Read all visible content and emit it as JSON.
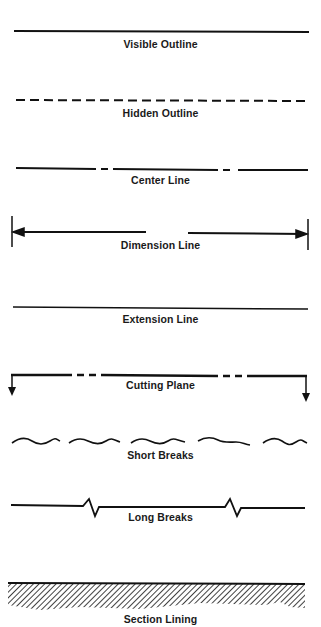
{
  "diagram": {
    "colors": {
      "ink": "#111111",
      "background": "#ffffff"
    },
    "items": [
      {
        "id": "visible-outline",
        "label": "Visible Outline",
        "style": "solid-thick"
      },
      {
        "id": "hidden-outline",
        "label": "Hidden Outline",
        "style": "dashed"
      },
      {
        "id": "center-line",
        "label": "Center Line",
        "style": "long-short-long"
      },
      {
        "id": "dimension-line",
        "label": "Dimension Line",
        "style": "arrows-with-extension-ticks"
      },
      {
        "id": "extension-line",
        "label": "Extension Line",
        "style": "solid-thin"
      },
      {
        "id": "cutting-plane",
        "label": "Cutting Plane",
        "style": "long-dash-dash-with-down-arrows"
      },
      {
        "id": "short-breaks",
        "label": "Short Breaks",
        "style": "wavy-segments"
      },
      {
        "id": "long-breaks",
        "label": "Long Breaks",
        "style": "line-with-zigzags"
      },
      {
        "id": "section-lining",
        "label": "Section Lining",
        "style": "hatched-band"
      }
    ]
  }
}
